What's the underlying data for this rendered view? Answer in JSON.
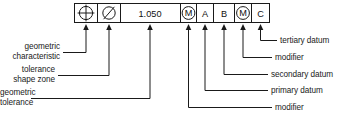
{
  "diagram": {
    "background_color": "#ffffff",
    "line_color": "#1a1a1a"
  },
  "feature_control_frame": {
    "cells": [
      {
        "id": "geometric-characteristic",
        "kind": "symbol",
        "symbol": "position-symbol",
        "text": ""
      },
      {
        "id": "tolerance-shape-zone",
        "kind": "symbol",
        "symbol": "diameter-symbol",
        "text": ""
      },
      {
        "id": "geometric-tolerance",
        "kind": "value",
        "symbol": "",
        "text": "1.050"
      },
      {
        "id": "tolerance-modifier",
        "kind": "symbol",
        "symbol": "mmc-modifier-symbol",
        "text": "M"
      },
      {
        "id": "primary-datum",
        "kind": "datum",
        "symbol": "",
        "text": "A"
      },
      {
        "id": "secondary-datum",
        "kind": "datum",
        "symbol": "",
        "text": "B"
      },
      {
        "id": "datum-modifier",
        "kind": "symbol",
        "symbol": "mmc-modifier-symbol",
        "text": "M"
      },
      {
        "id": "tertiary-datum",
        "kind": "datum",
        "symbol": "",
        "text": "C"
      }
    ]
  },
  "callouts": {
    "left": [
      {
        "id": "geometric-characteristic",
        "line1": "geometric",
        "line2": "characteristic"
      },
      {
        "id": "tolerance-shape-zone",
        "line1": "tolerance",
        "line2": "shape zone"
      },
      {
        "id": "geometric-tolerance",
        "line1": "geometric",
        "line2": "tolerance"
      }
    ],
    "right": [
      {
        "id": "tertiary-datum",
        "label": "tertiary datum"
      },
      {
        "id": "datum-modifier",
        "label": "modifier"
      },
      {
        "id": "secondary-datum",
        "label": "secondary datum"
      },
      {
        "id": "primary-datum",
        "label": "primary datum"
      },
      {
        "id": "tolerance-modifier",
        "label": "modifier"
      }
    ]
  }
}
